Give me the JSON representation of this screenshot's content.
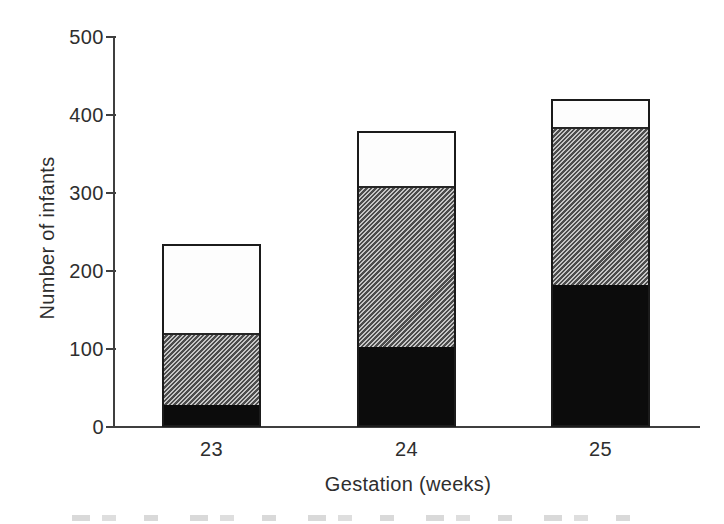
{
  "figure": {
    "background": "#ffffff",
    "axis_color": "#3f3f3f",
    "text_color": "#2e2e2e",
    "colors": {
      "bar_outline": "#1b1b1b",
      "black_fill": "#0c0c0c",
      "hatch_dark": "#4c4c4c",
      "hatch_light": "#c6c6c6",
      "white_fill": "#fdfdfd"
    }
  },
  "chart_data": {
    "type": "bar",
    "stacked": true,
    "title": "",
    "xlabel": "Gestation (weeks)",
    "ylabel": "Number of infants",
    "categories": [
      "23",
      "24",
      "25"
    ],
    "series": [
      {
        "name": "black",
        "style": "solid-black",
        "values": [
          25,
          100,
          180
        ]
      },
      {
        "name": "hatched",
        "style": "diagonal-hatch",
        "values": [
          93,
          207,
          202
        ]
      },
      {
        "name": "white",
        "style": "white",
        "values": [
          117,
          73,
          38
        ]
      }
    ],
    "stack_totals": [
      235,
      380,
      420
    ],
    "ylim": [
      0,
      500
    ],
    "yticks": [
      0,
      100,
      200,
      300,
      400,
      500
    ],
    "grid": false,
    "legend": "none"
  }
}
